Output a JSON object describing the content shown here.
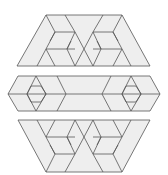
{
  "figure": {
    "colors": {
      "line": "#555555",
      "shade": "#eeeeee",
      "background": "#ffffff"
    },
    "pieces": [
      {
        "name": "top-trapezoid",
        "orientation": "wide-bottom",
        "hexagons": 2
      },
      {
        "name": "middle-band",
        "orientation": "elongated-hexagon",
        "hexagons": 2
      },
      {
        "name": "bottom-trapezoid",
        "orientation": "wide-top",
        "hexagons": 2
      }
    ]
  }
}
